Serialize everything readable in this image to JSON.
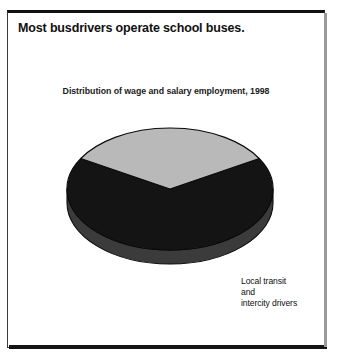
{
  "figure": {
    "title": "Most busdrivers operate school buses.",
    "subtitle": "Distribution of wage and salary employment, 1998"
  },
  "colors": {
    "dark_slice": "#141414",
    "dark_slice_side": "#3b3b3b",
    "light_slice": "#b9b9b9",
    "light_slice_side": "#8c8c8c",
    "outline": "#0a0a0a",
    "frame": "#3a3a3a",
    "page_background": "#ffffff",
    "dark_label_text": "#ffffff",
    "light_label_text": "#101010"
  },
  "chart_data": {
    "type": "pie",
    "title": "Most busdrivers operate school buses.",
    "subtitle": "Distribution of wage and salary employment, 1998",
    "xlabel": "",
    "ylabel": "",
    "grid": false,
    "legend": "none",
    "three_d": true,
    "labels_inside_slices": true,
    "categories": [
      "School busdrivers",
      "Local transit and intercity drivers"
    ],
    "values": [
      64,
      36
    ],
    "slices": [
      {
        "name": "School busdrivers",
        "label": "School\nbusdrivers",
        "value": 64,
        "color": "#141414",
        "text_color": "#ffffff",
        "start_angle_deg": 150,
        "end_angle_deg": 390
      },
      {
        "name": "Local transit and intercity drivers",
        "label": "Local transit\nand\nintercity drivers",
        "value": 36,
        "color": "#b9b9b9",
        "text_color": "#101010",
        "start_angle_deg": 30,
        "end_angle_deg": 150
      }
    ]
  }
}
